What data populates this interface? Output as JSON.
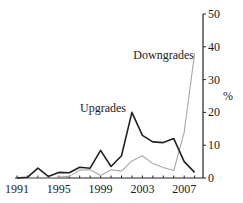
{
  "chart_data": {
    "type": "line",
    "title": "",
    "xlabel": "",
    "ylabel": "%",
    "ylim": [
      0,
      50
    ],
    "yticks": [
      0,
      10,
      20,
      30,
      40,
      50
    ],
    "xtick_labels": [
      "1991",
      "1995",
      "1999",
      "2003",
      "2007"
    ],
    "grid": false,
    "legend": "inline labels",
    "x": [
      1991,
      1992,
      1993,
      1994,
      1995,
      1996,
      1997,
      1998,
      1999,
      2000,
      2001,
      2002,
      2003,
      2004,
      2005,
      2006,
      2007,
      2008
    ],
    "series": [
      {
        "name": "Upgrades",
        "color": "#222222",
        "values": [
          0,
          0.2,
          3,
          0.5,
          1.7,
          1.6,
          3.3,
          3,
          8.4,
          3.5,
          6.8,
          20,
          13,
          11,
          10.8,
          12,
          5,
          1.7
        ]
      },
      {
        "name": "Downgrades",
        "color": "#a8a8a8",
        "values": [
          0,
          0,
          0,
          0,
          0.3,
          0.5,
          2.4,
          2.5,
          0.8,
          2.5,
          2.1,
          5.2,
          6.8,
          4.4,
          3.2,
          2.3,
          14,
          38
        ]
      }
    ],
    "annotations": [
      {
        "text": "Upgrades",
        "x": 2001.5,
        "y": 20
      },
      {
        "text": "Downgrades",
        "x": 2007.5,
        "y": 38
      }
    ]
  },
  "labels": {
    "upgrades": "Upgrades",
    "downgrades": "Downgrades",
    "y_unit": "%"
  }
}
